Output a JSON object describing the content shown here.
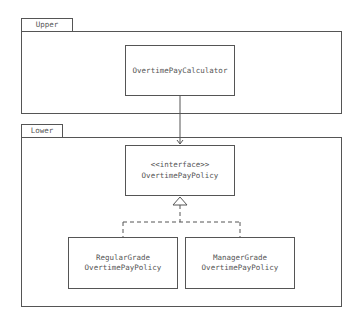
{
  "packages": [
    {
      "name": "Upper"
    },
    {
      "name": "Lower"
    }
  ],
  "classes": {
    "calculator": {
      "lines": [
        "OvertimePayCalculator"
      ]
    },
    "policy": {
      "stereotype": "<<interface>>",
      "name": "OvertimePayPolicy"
    },
    "regular": {
      "line1": "RegularGrade",
      "line2": "OvertimePayPolicy"
    },
    "manager": {
      "line1": "ManagerGrade",
      "line2": "OvertimePayPolicy"
    }
  },
  "relations": [
    {
      "from": "OvertimePayCalculator",
      "to": "OvertimePayPolicy",
      "type": "dependency-arrow"
    },
    {
      "from": "RegularGradeOvertimePayPolicy",
      "to": "OvertimePayPolicy",
      "type": "realization"
    },
    {
      "from": "ManagerGradeOvertimePayPolicy",
      "to": "OvertimePayPolicy",
      "type": "realization"
    }
  ],
  "colors": {
    "stroke": "#555555",
    "text": "#555555"
  }
}
